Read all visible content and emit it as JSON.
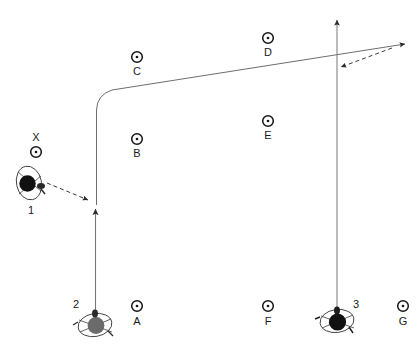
{
  "diagram": {
    "canvas": {
      "width": 419,
      "height": 353
    },
    "colors": {
      "background": "#ffffff",
      "line": "#555555",
      "marker_stroke": "#1a1a1a",
      "player_dark": "#111111",
      "player_gray": "#666666",
      "label": "#1a1a1a"
    },
    "cones": [
      {
        "id": "X",
        "label": "X",
        "x": 36,
        "y": 152,
        "label_x": 36,
        "label_y": 138,
        "label_pos": "above"
      },
      {
        "id": "C",
        "label": "C",
        "x": 137,
        "y": 57,
        "label_x": 137,
        "label_y": 72,
        "label_pos": "below"
      },
      {
        "id": "D",
        "label": "D",
        "x": 268,
        "y": 38,
        "label_x": 268,
        "label_y": 53,
        "label_pos": "below"
      },
      {
        "id": "B",
        "label": "B",
        "x": 137,
        "y": 139,
        "label_x": 137,
        "label_y": 154,
        "label_pos": "below"
      },
      {
        "id": "E",
        "label": "E",
        "x": 268,
        "y": 121,
        "label_x": 268,
        "label_y": 136,
        "label_pos": "below"
      },
      {
        "id": "A",
        "label": "A",
        "x": 137,
        "y": 306,
        "label_x": 137,
        "label_y": 322,
        "label_pos": "below"
      },
      {
        "id": "F",
        "label": "F",
        "x": 268,
        "y": 306,
        "label_x": 268,
        "label_y": 322,
        "label_pos": "below"
      },
      {
        "id": "G",
        "label": "G",
        "x": 403,
        "y": 306,
        "label_x": 403,
        "label_y": 322,
        "label_pos": "below"
      }
    ],
    "players": [
      {
        "id": "1",
        "label": "1",
        "x": 30,
        "y": 184,
        "fill": "#111111",
        "label_x": 31,
        "label_y": 210,
        "label_pos": "below"
      },
      {
        "id": "2",
        "label": "2",
        "x": 95,
        "y": 324,
        "fill": "#666666",
        "label_x": 76,
        "label_y": 303,
        "label_pos": "left"
      },
      {
        "id": "3",
        "label": "3",
        "x": 337,
        "y": 320,
        "fill": "#111111",
        "label_x": 356,
        "label_y": 303,
        "label_pos": "right"
      }
    ],
    "paths": [
      {
        "name": "player-2-run-path",
        "kind": "solid-run",
        "from": "2",
        "to": "upper-right",
        "has_arrow": true
      },
      {
        "name": "player-1-pass-path",
        "kind": "dashed-pass",
        "from": "1",
        "to": "player-2-run-path",
        "has_arrow": true
      },
      {
        "name": "player-3-run-path",
        "kind": "solid-run",
        "from": "3",
        "to": "top",
        "has_arrow": true
      },
      {
        "name": "player-3-pass-path",
        "kind": "dashed-pass",
        "from": "upper-right",
        "to": "player-3-run-path",
        "has_arrow": true
      }
    ],
    "legend": {
      "cone_icon": "cone-marker-icon",
      "player_icon": "player-top-view-icon",
      "solid_line_meaning": "run",
      "dashed_line_meaning": "pass"
    }
  }
}
